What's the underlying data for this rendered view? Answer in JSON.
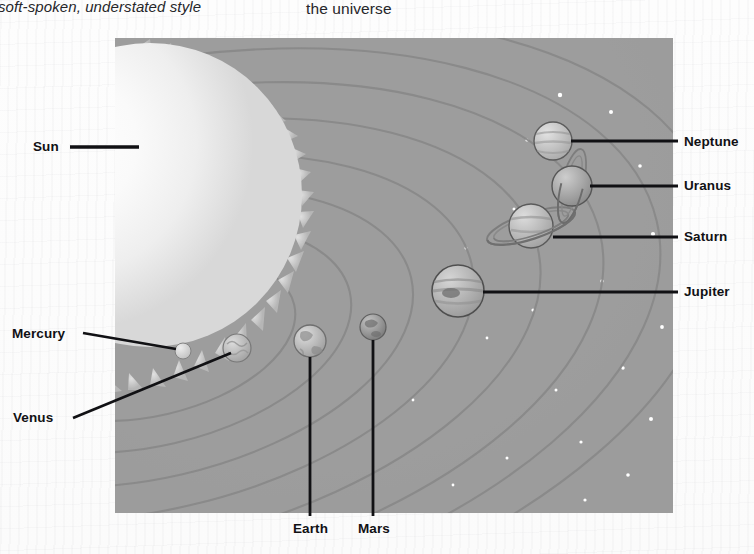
{
  "page": {
    "header_left": "soft-spoken, understated style",
    "header_right": "the universe"
  },
  "diagram": {
    "name": "solar-system-diagram",
    "background_color": "#9d9d9d",
    "frame": {
      "x": 115,
      "y": 38,
      "width": 558,
      "height": 475
    },
    "labels": {
      "sun": "Sun",
      "mercury": "Mercury",
      "venus": "Venus",
      "earth": "Earth",
      "mars": "Mars",
      "jupiter": "Jupiter",
      "saturn": "Saturn",
      "uranus": "Uranus",
      "neptune": "Neptune"
    },
    "bodies": [
      {
        "name": "sun",
        "label": "Sun",
        "cx": 150,
        "cy": 195,
        "r": 150,
        "color": "#f2f2f2",
        "has_corona": true
      },
      {
        "name": "mercury",
        "label": "Mercury",
        "cx": 183,
        "cy": 351,
        "r": 8,
        "color": "#d2d2d2"
      },
      {
        "name": "venus",
        "label": "Venus",
        "cx": 237,
        "cy": 348,
        "r": 14,
        "color": "#bdbdbd"
      },
      {
        "name": "earth",
        "label": "Earth",
        "cx": 310,
        "cy": 341,
        "r": 16,
        "color": "#b5b5b5"
      },
      {
        "name": "mars",
        "label": "Mars",
        "cx": 373,
        "cy": 327,
        "r": 13,
        "color": "#989898"
      },
      {
        "name": "jupiter",
        "label": "Jupiter",
        "cx": 458,
        "cy": 291,
        "r": 26,
        "color": "#b0b0b0"
      },
      {
        "name": "saturn",
        "label": "Saturn",
        "cx": 531,
        "cy": 226,
        "r": 22,
        "color": "#b8b8b8",
        "has_rings": true
      },
      {
        "name": "uranus",
        "label": "Uranus",
        "cx": 572,
        "cy": 186,
        "r": 20,
        "color": "#a6a6a6",
        "has_rings": true
      },
      {
        "name": "neptune",
        "label": "Neptune",
        "cx": 553,
        "cy": 141,
        "r": 19,
        "color": "#c0c0c0"
      }
    ],
    "orbit_count": 8,
    "star_count": 22
  }
}
